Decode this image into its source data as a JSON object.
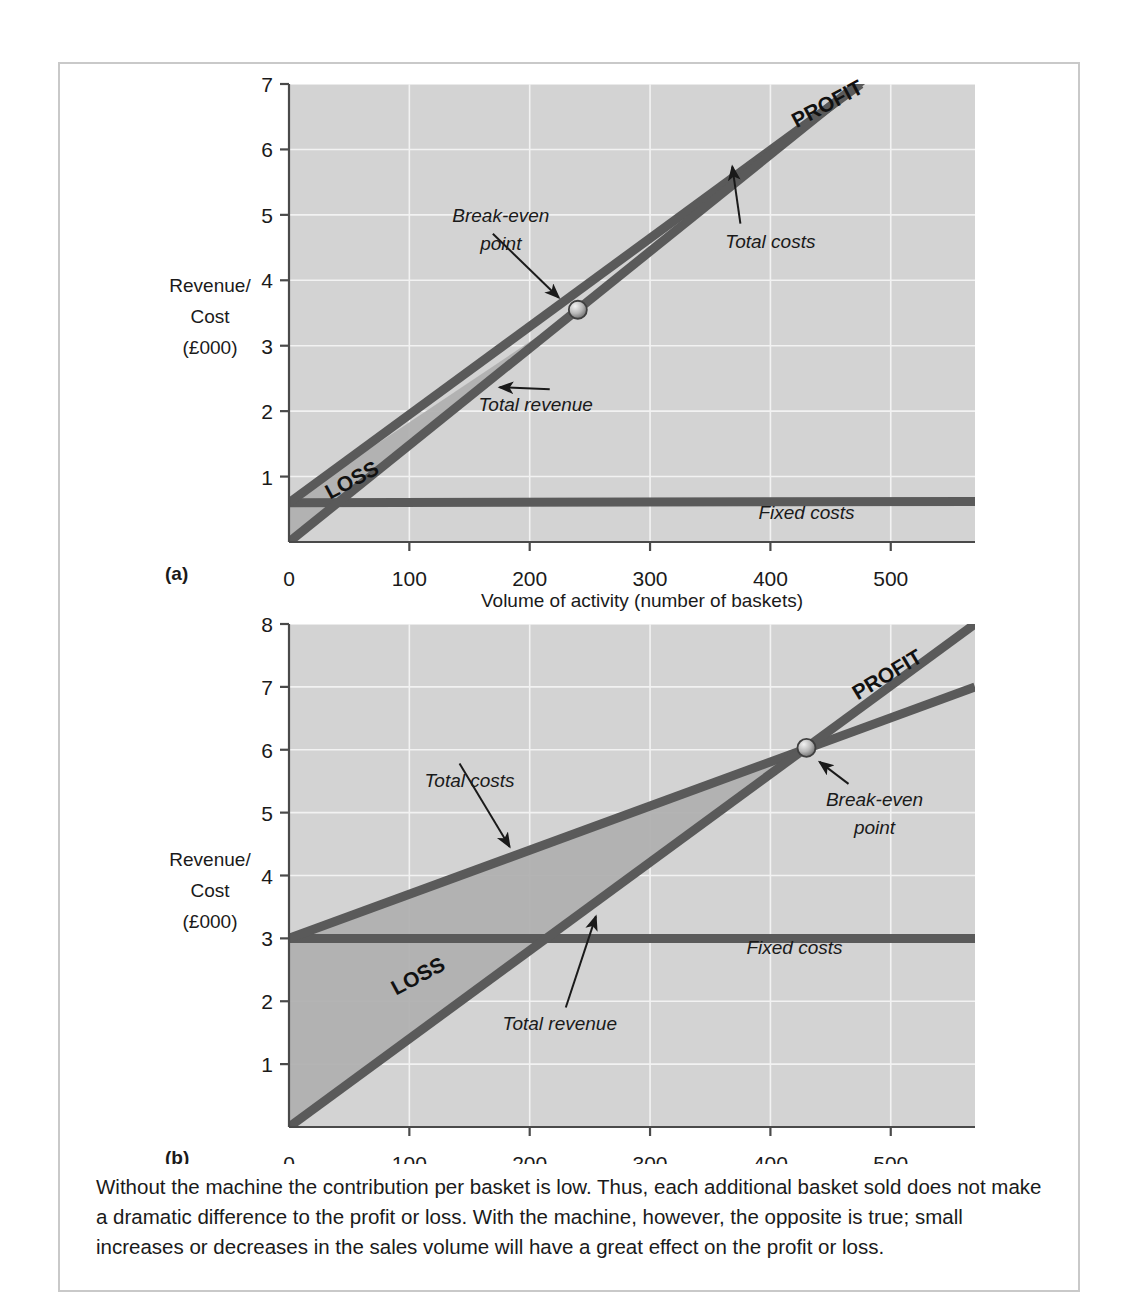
{
  "figure": {
    "caption": "Without the machine the contribution per basket is low. Thus, each additional basket sold does not make a dramatic difference to the profit or loss. With the machine, however, the opposite is true; small increases or decreases in the sales volume will have a great effect on the profit or loss.",
    "panel_a_label": "(a)",
    "panel_b_label": "(b)",
    "colors": {
      "plot_background": "#d3d3d3",
      "line": "#5a5a5a",
      "loss_fill": "#b0b0b0",
      "gridline": "#f2f2f2",
      "frame_border": "#c9c9c9",
      "text": "#1a1a1a"
    }
  },
  "chart_data": [
    {
      "id": "chart-a",
      "type": "line",
      "title": "",
      "panel": "(a)",
      "xlabel": "Volume of activity (number of baskets)",
      "ylabel_lines": [
        "Revenue/",
        "Cost",
        "(£000)"
      ],
      "xlim": [
        0,
        570
      ],
      "ylim": [
        0,
        7
      ],
      "xticks": [
        0,
        100,
        200,
        300,
        400,
        500
      ],
      "xticklabels": [
        "0",
        "100",
        "200",
        "300",
        "400",
        "500"
      ],
      "yticks": [
        1,
        2,
        3,
        4,
        5,
        6,
        7
      ],
      "yticklabels": [
        "1",
        "2",
        "3",
        "4",
        "5",
        "6",
        "7"
      ],
      "grid": true,
      "series": [
        {
          "name": "Total revenue",
          "x": [
            0,
            520
          ],
          "values": [
            0,
            7.7
          ],
          "label": "Total revenue",
          "label_x": 205,
          "label_y": 2.0
        },
        {
          "name": "Total costs",
          "x": [
            0,
            475
          ],
          "values": [
            0.6,
            7.0
          ],
          "label": "Total costs",
          "label_x": 400,
          "label_y": 4.5
        },
        {
          "name": "Fixed costs",
          "x": [
            0,
            570
          ],
          "values": [
            0.6,
            0.62
          ],
          "label": "Fixed costs",
          "label_x": 430,
          "label_y": 0.35
        }
      ],
      "annotations": [
        {
          "text": "Break-even",
          "text2": "point",
          "x": 240,
          "y": 3.55,
          "kind": "break-even-point"
        },
        {
          "text": "PROFIT",
          "x": 450,
          "y": 6.6,
          "kind": "region-label",
          "rotation": -28
        },
        {
          "text": "LOSS",
          "x": 55,
          "y": 0.85,
          "kind": "region-label",
          "rotation": -28
        }
      ],
      "break_even": {
        "x": 240,
        "y": 3.55
      }
    },
    {
      "id": "chart-b",
      "type": "line",
      "title": "",
      "panel": "(b)",
      "xlabel": "Volume of activity (number of baskets)",
      "ylabel_lines": [
        "Revenue/",
        "Cost",
        "(£000)"
      ],
      "xlim": [
        0,
        570
      ],
      "ylim": [
        0,
        8
      ],
      "xticks": [
        0,
        100,
        200,
        300,
        400,
        500
      ],
      "xticklabels": [
        "0",
        "100",
        "200",
        "300",
        "400",
        "500"
      ],
      "yticks": [
        1,
        2,
        3,
        4,
        5,
        6,
        7,
        8
      ],
      "yticklabels": [
        "1",
        "2",
        "3",
        "4",
        "5",
        "6",
        "7",
        "8"
      ],
      "grid": true,
      "series": [
        {
          "name": "Total revenue",
          "x": [
            0,
            570
          ],
          "values": [
            0,
            8.0
          ],
          "label": "Total revenue",
          "label_x": 225,
          "label_y": 1.55
        },
        {
          "name": "Total costs",
          "x": [
            0,
            570
          ],
          "values": [
            3.0,
            7.0
          ],
          "label": "Total costs",
          "label_x": 150,
          "label_y": 5.4
        },
        {
          "name": "Fixed costs",
          "x": [
            0,
            570
          ],
          "values": [
            3.0,
            3.0
          ],
          "label": "Fixed costs",
          "label_x": 420,
          "label_y": 2.75
        }
      ],
      "annotations": [
        {
          "text": "Break-even",
          "text2": "point",
          "x": 430,
          "y": 6.03,
          "kind": "break-even-point"
        },
        {
          "text": "PROFIT",
          "x": 500,
          "y": 7.1,
          "kind": "region-label",
          "rotation": -31
        },
        {
          "text": "LOSS",
          "x": 110,
          "y": 2.3,
          "kind": "region-label",
          "rotation": -28
        }
      ],
      "break_even": {
        "x": 430,
        "y": 6.03
      }
    }
  ]
}
